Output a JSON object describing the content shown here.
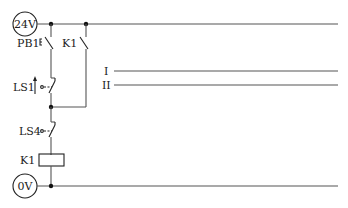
{
  "diagram": {
    "type": "ladder-control-circuit",
    "supply_positive": "24V",
    "supply_negative": "0V",
    "components": {
      "pb1": "PB1",
      "k1_contact": "K1",
      "ls1": "LS1",
      "ls4": "LS4",
      "k1_coil": "K1"
    },
    "rungs": {
      "rung1": "I",
      "rung2": "II"
    },
    "colors": {
      "wire": "#555555",
      "symbol": "#222222",
      "background": "#ffffff"
    }
  }
}
